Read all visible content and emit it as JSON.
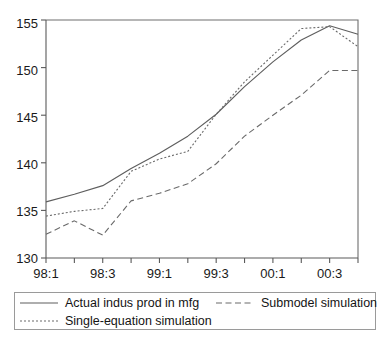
{
  "chart_data": {
    "type": "line",
    "title": "",
    "subtitle": "",
    "xlabel": "",
    "ylabel": "",
    "ylim": [
      130,
      155
    ],
    "yticks": [
      130,
      135,
      140,
      145,
      150,
      155
    ],
    "ytick_labels": [
      "130",
      "135",
      "140",
      "145",
      "150",
      "155"
    ],
    "grid": false,
    "legend_position": "bottom",
    "x": [
      "98:1",
      "98:2",
      "98:3",
      "98:4",
      "99:1",
      "99:2",
      "99:3",
      "99:4",
      "00:1",
      "00:2",
      "00:3",
      "00:4"
    ],
    "xtick_labels": [
      "98:1",
      "98:3",
      "99:1",
      "99:3",
      "00:1",
      "00:3"
    ],
    "xtick_label_indices": [
      0,
      2,
      4,
      6,
      8,
      10
    ],
    "categories": [
      "98:1",
      "98:2",
      "98:3",
      "98:4",
      "99:1",
      "99:2",
      "99:3",
      "99:4",
      "00:1",
      "00:2",
      "00:3",
      "00:4"
    ],
    "series": [
      {
        "name": "Actual indus prod in mfg",
        "style": "solid",
        "color": "#5e5e5e",
        "values": [
          135.9,
          136.7,
          137.6,
          139.4,
          141.0,
          142.8,
          145.1,
          148.0,
          150.6,
          152.9,
          154.4,
          153.5
        ]
      },
      {
        "name": "Submodel simulation",
        "style": "dashed",
        "color": "#6a6a6a",
        "values": [
          132.5,
          133.9,
          132.4,
          136.0,
          136.8,
          137.8,
          139.9,
          142.8,
          145.0,
          147.1,
          149.7,
          149.7
        ]
      },
      {
        "name": "Single-equation simulation",
        "style": "dotted",
        "color": "#6a6a6a",
        "values": [
          134.4,
          134.9,
          135.2,
          139.1,
          140.4,
          141.2,
          145.1,
          148.5,
          151.3,
          154.1,
          154.3,
          152.2
        ]
      }
    ]
  },
  "legend": {
    "entries": [
      {
        "label": "Actual indus prod in mfg",
        "style": "solid"
      },
      {
        "label": "Submodel simulation",
        "style": "dashed"
      },
      {
        "label": "Single-equation simulation",
        "style": "dotted"
      }
    ]
  },
  "colors": {
    "axis": "#5a5a5a",
    "frame": "#6e6e6e",
    "text": "#1a1a1a",
    "background": "#ffffff",
    "legend_border": "#9a9a9a"
  }
}
